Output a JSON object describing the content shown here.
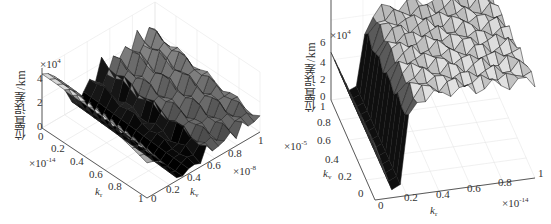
{
  "chart_data": [
    {
      "type": "surface",
      "panel": "left",
      "title": "",
      "zlabel": "位置误差/km",
      "z_multiplier": "×10",
      "z_exponent": "4",
      "zticks": [
        "0",
        "2",
        "4"
      ],
      "zlim": [
        0,
        40000
      ],
      "x_axis": {
        "label": "k",
        "label_sub": "r",
        "multiplier": "×10",
        "exponent": "-14",
        "ticks": [
          "0",
          "0.2",
          "0.4",
          "0.6",
          "0.8",
          "1"
        ],
        "range": [
          0,
          1e-14
        ]
      },
      "y_axis": {
        "label": "k",
        "label_sub": "v",
        "multiplier": "×10",
        "exponent": "-8",
        "ticks": [
          "0",
          "0.2",
          "0.4",
          "0.6",
          "0.8",
          "1"
        ],
        "range": [
          0,
          1e-08
        ]
      },
      "grid": true,
      "description": "Position error surface: high (~3.5e4 km) at small k_v, descends to a dark valley near k_v≈0.3–0.6, then oscillating peaks (~2–3e4) at larger k_v",
      "z_profile_along_kv": [
        3.6,
        3.4,
        3.0,
        2.4,
        1.5,
        0.6,
        0.2,
        0.8,
        1.6,
        1.0,
        2.2,
        1.2,
        2.0,
        1.4,
        2.4,
        1.6,
        2.6,
        1.8,
        2.5,
        2.0
      ]
    },
    {
      "type": "surface",
      "panel": "right",
      "title": "",
      "zlabel": "位置误差/km",
      "z_multiplier": "×10",
      "z_exponent": "4",
      "zticks": [
        "0",
        "2",
        "4",
        "6"
      ],
      "zlim": [
        0,
        60000
      ],
      "x_axis": {
        "label": "k",
        "label_sub": "r",
        "multiplier": "×10",
        "exponent": "-14",
        "ticks": [
          "0",
          "0.2",
          "0.4",
          "0.6",
          "0.8",
          "1"
        ],
        "range": [
          0,
          1e-14
        ]
      },
      "y_axis": {
        "label": "k",
        "label_sub": "v",
        "multiplier": "×10",
        "exponent": "-5",
        "ticks": [
          "0",
          "0.2",
          "0.4",
          "0.6",
          "0.8",
          "1"
        ],
        "range": [
          0,
          1e-05
        ]
      },
      "grid": true,
      "description": "Position error surface: ~2.8e4 at k_r=0, drops to a dark valley near k_r≈0.1, rises sharply to a flat plateau (~4.5–5e4) for k_r>0.2",
      "z_profile_along_kr": [
        2.8,
        1.6,
        0.4,
        0.6,
        3.8,
        4.6,
        4.8,
        4.9,
        4.8,
        4.9,
        5.0,
        4.9,
        4.8,
        4.9,
        5.0,
        4.9,
        4.8,
        4.9,
        5.0,
        4.8
      ]
    }
  ],
  "ui": {
    "left": {
      "zlabel": "位置误差/km",
      "zmult": "×10",
      "zexp": "4",
      "zticks": [
        "4",
        "2",
        "0"
      ],
      "xticks": [
        "0",
        "0.2",
        "0.4",
        "0.6",
        "0.8",
        "1"
      ],
      "yticks": [
        "0",
        "0.2",
        "0.4",
        "0.6",
        "0.8",
        "1"
      ],
      "xmult": "×10",
      "xexp": "-14",
      "ymult": "×10",
      "yexp": "-8",
      "xlabel": "k",
      "xsub": "r",
      "ylabel": "k",
      "ysub": "v"
    },
    "right": {
      "zlabel": "位置误差/km",
      "zmult": "×10",
      "zexp": "4",
      "zticks": [
        "6",
        "4",
        "2",
        "0"
      ],
      "xticks": [
        "0",
        "0.2",
        "0.4",
        "0.6",
        "0.8",
        "1"
      ],
      "yticks": [
        "1",
        "0.8",
        "0.6",
        "0.4",
        "0.2",
        "0"
      ],
      "xmult": "×10",
      "xexp": "-14",
      "ymult": "×10",
      "yexp": "-5",
      "xlabel": "k",
      "xsub": "r",
      "ylabel": "k",
      "ysub": "v"
    }
  }
}
